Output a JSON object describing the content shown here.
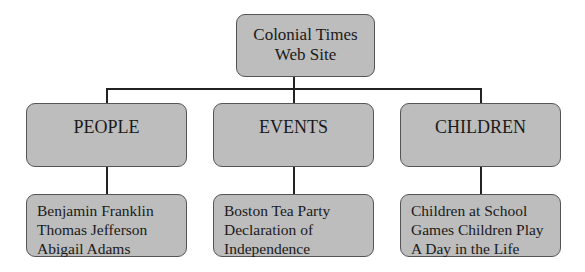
{
  "diagram": {
    "root": {
      "lines": [
        "Colonial Times",
        "Web Site"
      ]
    },
    "categories": [
      {
        "label": "PEOPLE",
        "items": [
          "Benjamin Franklin",
          "Thomas Jefferson",
          "Abigail Adams"
        ]
      },
      {
        "label": "EVENTS",
        "items": [
          "Boston Tea Party",
          "Declaration of",
          "Independence"
        ]
      },
      {
        "label": "CHILDREN",
        "items": [
          "Children at School",
          "Games Children Play",
          "A Day in the Life"
        ]
      }
    ],
    "colors": {
      "box_fill": "#bdbdbd",
      "box_border": "#555555",
      "connector": "#222222"
    }
  }
}
